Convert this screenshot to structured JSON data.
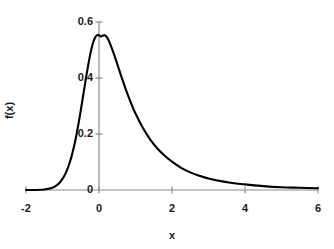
{
  "chart_data": {
    "type": "line",
    "title": "",
    "xlabel": "x",
    "ylabel": "f(x)",
    "xlim": [
      -2,
      6
    ],
    "ylim": [
      0,
      0.6
    ],
    "grid": false,
    "legend": false,
    "legend_position": "none",
    "line_color": "#000000",
    "axis_color": "#808080",
    "x_ticks": [
      -2,
      0,
      2,
      4,
      6
    ],
    "x_tick_labels": [
      "-2",
      "0",
      "2",
      "4",
      "6"
    ],
    "y_ticks": [
      0,
      0.2,
      0.4,
      0.6
    ],
    "y_tick_labels": [
      "0",
      "0.2",
      "0.4",
      "0.6"
    ],
    "peak": {
      "x": 0.15,
      "y": 0.553
    },
    "x": [
      -2.0,
      -1.8,
      -1.6,
      -1.5,
      -1.4,
      -1.3,
      -1.2,
      -1.1,
      -1.0,
      -0.95,
      -0.9,
      -0.85,
      -0.8,
      -0.75,
      -0.7,
      -0.65,
      -0.6,
      -0.55,
      -0.5,
      -0.45,
      -0.4,
      -0.35,
      -0.3,
      -0.25,
      -0.2,
      -0.15,
      -0.1,
      -0.05,
      0.0,
      0.05,
      0.1,
      0.15,
      0.2,
      0.25,
      0.3,
      0.4,
      0.5,
      0.6,
      0.7,
      0.8,
      0.9,
      1.0,
      1.2,
      1.4,
      1.6,
      1.8,
      2.0,
      2.25,
      2.5,
      2.75,
      3.0,
      3.25,
      3.5,
      3.75,
      4.0,
      4.5,
      5.0,
      5.5,
      6.0
    ],
    "y": [
      0.0,
      0.0,
      0.001,
      0.002,
      0.004,
      0.007,
      0.013,
      0.023,
      0.04,
      0.051,
      0.064,
      0.08,
      0.099,
      0.121,
      0.147,
      0.176,
      0.209,
      0.245,
      0.284,
      0.324,
      0.365,
      0.405,
      0.443,
      0.478,
      0.508,
      0.531,
      0.546,
      0.553,
      0.553,
      0.548,
      0.551,
      0.553,
      0.548,
      0.538,
      0.524,
      0.489,
      0.45,
      0.41,
      0.372,
      0.336,
      0.303,
      0.273,
      0.222,
      0.181,
      0.148,
      0.122,
      0.101,
      0.079,
      0.063,
      0.051,
      0.041,
      0.034,
      0.028,
      0.023,
      0.02,
      0.014,
      0.01,
      0.008,
      0.006
    ],
    "series": [
      {
        "name": "f(x)",
        "color": "#000000",
        "line_width": 2
      }
    ]
  },
  "axes": {
    "x_title": "x",
    "y_title": "f(x)"
  }
}
